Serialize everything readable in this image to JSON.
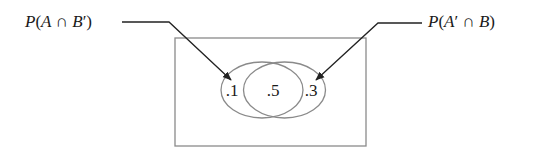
{
  "diagram": {
    "type": "venn",
    "colors": {
      "background": "#ffffff",
      "frame": "#8a8a8a",
      "ellipse": "#8a8a8a",
      "leader": "#222222",
      "text": "#1a1a1a"
    },
    "universe": {
      "x": 175,
      "y": 38,
      "width": 191,
      "height": 108
    },
    "sets": [
      {
        "name": "A",
        "cx": 262,
        "cy": 90,
        "rx": 41,
        "ry": 28
      },
      {
        "name": "B",
        "cx": 284.5,
        "cy": 90,
        "rx": 41,
        "ry": 28
      }
    ],
    "regions": [
      {
        "id": "a-only",
        "label": ".1",
        "x": 232,
        "y": 96
      },
      {
        "id": "a-and-b",
        "label": ".5",
        "x": 273,
        "y": 96
      },
      {
        "id": "b-only",
        "label": ".3",
        "x": 311,
        "y": 96
      }
    ],
    "callouts": [
      {
        "id": "left",
        "text": {
          "p": "P",
          "open": "(",
          "a": "A",
          "cap": " ∩ ",
          "b": "B",
          "prime": "′",
          "close": ")"
        },
        "text_x": 25,
        "text_y": 27,
        "points": "122,22 169,22 231,80"
      },
      {
        "id": "right",
        "text": {
          "p": "P",
          "open": "(",
          "a": "A",
          "prime": "′",
          "cap": " ∩ ",
          "b": "B",
          "close": ")"
        },
        "text_x": 428,
        "text_y": 27,
        "points": "422,23 378,23 316,80"
      }
    ]
  }
}
